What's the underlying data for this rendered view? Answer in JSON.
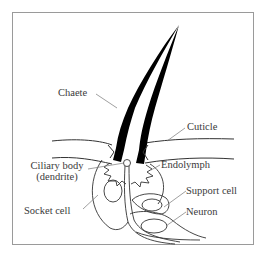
{
  "figure": {
    "type": "diagram",
    "labels": {
      "chaete": "Chaete",
      "cuticle": "Cuticle",
      "ciliary_body_line1": "Ciliary body",
      "ciliary_body_line2": "(dendrite)",
      "endolymph": "Endolymph",
      "socket_cell": "Socket cell",
      "support_cell": "Support cell",
      "neuron": "Neuron"
    },
    "colors": {
      "ink": "#000000",
      "line": "#3a3a3a",
      "frame": "#9a9a9a",
      "background": "#ffffff"
    }
  }
}
